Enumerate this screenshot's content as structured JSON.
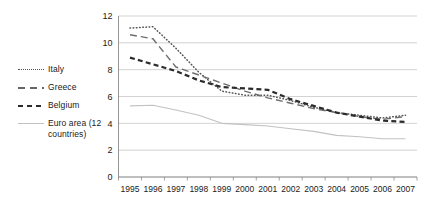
{
  "chart_data": {
    "type": "line",
    "title": "",
    "subtitle": "",
    "xlabel": "",
    "ylabel": "",
    "categories": [
      "1995",
      "1996",
      "1997",
      "1998",
      "1999",
      "2000",
      "2001",
      "2002",
      "2003",
      "2004",
      "2005",
      "2006",
      "2007"
    ],
    "ylim": [
      0,
      12
    ],
    "yticks": [
      0,
      2,
      4,
      6,
      8,
      10,
      12
    ],
    "ytick_labels": [
      "0",
      "2",
      "4",
      "6",
      "8",
      "10",
      "12"
    ],
    "grid": "horizontal",
    "legend_position": "left-outside",
    "series": [
      {
        "name": "Italy",
        "style": "dotted",
        "color": "#555555",
        "values": [
          11.1,
          11.2,
          9.6,
          7.8,
          6.4,
          6.1,
          6.1,
          5.7,
          5.2,
          4.8,
          4.6,
          4.4,
          4.6
        ]
      },
      {
        "name": "Greece",
        "style": "dashed",
        "color": "#6e6e6e",
        "values": [
          10.6,
          10.3,
          8.2,
          7.6,
          7.0,
          6.4,
          5.9,
          5.5,
          5.1,
          4.8,
          4.5,
          4.3,
          4.5
        ]
      },
      {
        "name": "Belgium",
        "style": "bold-dashed",
        "color": "#2b2b2b",
        "values": [
          8.9,
          8.4,
          7.9,
          7.2,
          6.7,
          6.6,
          6.5,
          5.8,
          5.3,
          4.8,
          4.5,
          4.2,
          4.1
        ]
      },
      {
        "name": "Euro area (12\ncountries)",
        "style": "solid-thin",
        "color": "#c2c2c2",
        "values": [
          5.3,
          5.35,
          5.0,
          4.6,
          4.0,
          3.9,
          3.8,
          3.6,
          3.4,
          3.1,
          3.0,
          2.85,
          2.85
        ]
      }
    ]
  },
  "legend": {
    "items": [
      {
        "label": "Italy"
      },
      {
        "label": "Greece"
      },
      {
        "label": "Belgium"
      },
      {
        "label": "Euro area (12\ncountries)"
      }
    ]
  }
}
